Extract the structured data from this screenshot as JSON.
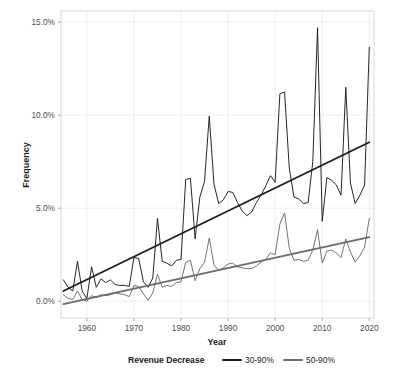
{
  "chart_data": {
    "type": "line",
    "title": "",
    "xlabel": "Year",
    "ylabel": "Frequency",
    "xlim": [
      1954.5,
      2021.0
    ],
    "ylim": [
      -0.9,
      15.6
    ],
    "grid": true,
    "legend_position": "bottom",
    "legend_title": "Revenue Decrease",
    "x_ticks": [
      1960,
      1970,
      1980,
      1990,
      2000,
      2010,
      2020
    ],
    "x_tick_labels": [
      "1960",
      "1970",
      "1980",
      "1990",
      "2000",
      "2010",
      "2020"
    ],
    "y_ticks": [
      0,
      5,
      10,
      15
    ],
    "y_tick_labels": [
      "0.0%",
      "5.0%",
      "10.0%",
      "15.0%"
    ],
    "series": [
      {
        "name": "30-90%",
        "color": "#1a1a1a",
        "trend": {
          "x": [
            1955,
            2020
          ],
          "y": [
            0.55,
            8.55
          ],
          "color": "#1a1a1a"
        },
        "x": [
          1955,
          1956,
          1957,
          1958,
          1959,
          1960,
          1961,
          1962,
          1963,
          1964,
          1965,
          1966,
          1967,
          1968,
          1969,
          1970,
          1971,
          1972,
          1973,
          1974,
          1975,
          1976,
          1977,
          1978,
          1979,
          1980,
          1981,
          1982,
          1983,
          1984,
          1985,
          1986,
          1987,
          1988,
          1989,
          1990,
          1991,
          1992,
          1993,
          1994,
          1995,
          1996,
          1997,
          1998,
          1999,
          2000,
          2001,
          2002,
          2003,
          2004,
          2005,
          2006,
          2007,
          2008,
          2009,
          2010,
          2011,
          2012,
          2013,
          2014,
          2015,
          2016,
          2017,
          2018,
          2019,
          2020
        ],
        "y": [
          1.15,
          0.75,
          0.55,
          2.15,
          0.55,
          0.15,
          1.85,
          0.75,
          1.2,
          1.0,
          1.15,
          0.9,
          0.85,
          0.85,
          0.8,
          2.35,
          2.3,
          1.05,
          0.75,
          1.25,
          4.45,
          2.15,
          2.05,
          1.9,
          2.2,
          2.25,
          6.55,
          6.6,
          3.35,
          5.6,
          6.45,
          9.95,
          6.3,
          5.25,
          5.45,
          5.9,
          5.85,
          5.3,
          4.85,
          4.6,
          4.8,
          5.3,
          5.7,
          6.2,
          6.75,
          6.4,
          11.15,
          11.25,
          7.15,
          5.6,
          5.5,
          5.25,
          5.3,
          7.5,
          14.7,
          4.3,
          6.65,
          6.5,
          6.25,
          5.7,
          11.5,
          6.35,
          5.25,
          5.7,
          6.25,
          13.65
        ]
      },
      {
        "name": "50-90%",
        "color": "#6b6b6b",
        "trend": {
          "x": [
            1955,
            2020
          ],
          "y": [
            -0.15,
            3.45
          ],
          "color": "#6b6b6b"
        },
        "x": [
          1955,
          1956,
          1957,
          1958,
          1959,
          1960,
          1961,
          1962,
          1963,
          1964,
          1965,
          1966,
          1967,
          1968,
          1969,
          1970,
          1971,
          1972,
          1973,
          1974,
          1975,
          1976,
          1977,
          1978,
          1979,
          1980,
          1981,
          1982,
          1983,
          1984,
          1985,
          1986,
          1987,
          1988,
          1989,
          1990,
          1991,
          1992,
          1993,
          1994,
          1995,
          1996,
          1997,
          1998,
          1999,
          2000,
          2001,
          2002,
          2003,
          2004,
          2005,
          2006,
          2007,
          2008,
          2009,
          2010,
          2011,
          2012,
          2013,
          2014,
          2015,
          2016,
          2017,
          2018,
          2019,
          2020
        ],
        "y": [
          0.35,
          0.15,
          0.1,
          0.55,
          0.1,
          0.0,
          0.3,
          0.2,
          0.35,
          0.3,
          0.35,
          0.45,
          0.4,
          0.35,
          0.25,
          0.85,
          0.8,
          0.4,
          0.05,
          0.45,
          1.45,
          0.75,
          0.85,
          0.8,
          1.0,
          1.05,
          2.1,
          2.2,
          1.1,
          1.75,
          2.1,
          3.4,
          1.95,
          1.65,
          1.8,
          2.0,
          2.05,
          1.85,
          1.8,
          1.75,
          1.75,
          1.9,
          2.1,
          2.25,
          2.6,
          2.5,
          4.15,
          4.75,
          2.85,
          2.2,
          2.25,
          2.15,
          2.2,
          2.75,
          3.85,
          2.05,
          2.7,
          2.75,
          2.6,
          2.35,
          3.35,
          2.65,
          2.1,
          2.45,
          2.9,
          4.45
        ]
      }
    ]
  },
  "axes": {
    "y_label": "Frequency",
    "x_label": "Year",
    "y_tick_0": "0.0%",
    "y_tick_1": "5.0%",
    "y_tick_2": "10.0%",
    "y_tick_3": "15.0%",
    "x_tick_0": "1960",
    "x_tick_1": "1970",
    "x_tick_2": "1980",
    "x_tick_3": "1990",
    "x_tick_4": "2000",
    "x_tick_5": "2010",
    "x_tick_6": "2020"
  },
  "legend": {
    "title": "Revenue Decrease",
    "items": [
      {
        "label": "30-90%",
        "color": "#1a1a1a"
      },
      {
        "label": "50-90%",
        "color": "#6b6b6b"
      }
    ]
  }
}
